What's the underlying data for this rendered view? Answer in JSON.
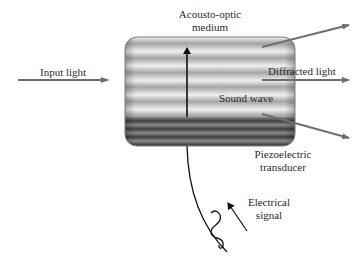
{
  "diagram": {
    "labels": {
      "medium_line1": "Acousto-optic",
      "medium_line2": "medium",
      "input_light": "Input light",
      "diffracted_light": "Diffracted light",
      "sound_wave": "Sound wave",
      "transducer_line1": "Piezoelectric",
      "transducer_line2": "transducer",
      "signal_line1": "Electrical",
      "signal_line2": "signal"
    },
    "colors": {
      "light_arrow": "#6e6e6e",
      "stripe_light": "#f2f2f2",
      "stripe_mid": "#a8a8a8",
      "transducer_dark": "#4a4a4a",
      "ink": "#111111"
    },
    "elements": [
      {
        "id": "input-light-arrow",
        "from": [
          18,
          80
        ],
        "to": [
          108,
          80
        ]
      },
      {
        "id": "diffracted-arrow-top",
        "from": [
          262,
          47
        ],
        "to": [
          349,
          25
        ]
      },
      {
        "id": "diffracted-arrow-middle",
        "from": [
          262,
          80
        ],
        "to": [
          349,
          80
        ]
      },
      {
        "id": "diffracted-arrow-bottom",
        "from": [
          262,
          114
        ],
        "to": [
          349,
          138
        ]
      },
      {
        "id": "sound-wave-arrow",
        "from": [
          187,
          117
        ],
        "to": [
          187,
          47
        ]
      }
    ]
  }
}
